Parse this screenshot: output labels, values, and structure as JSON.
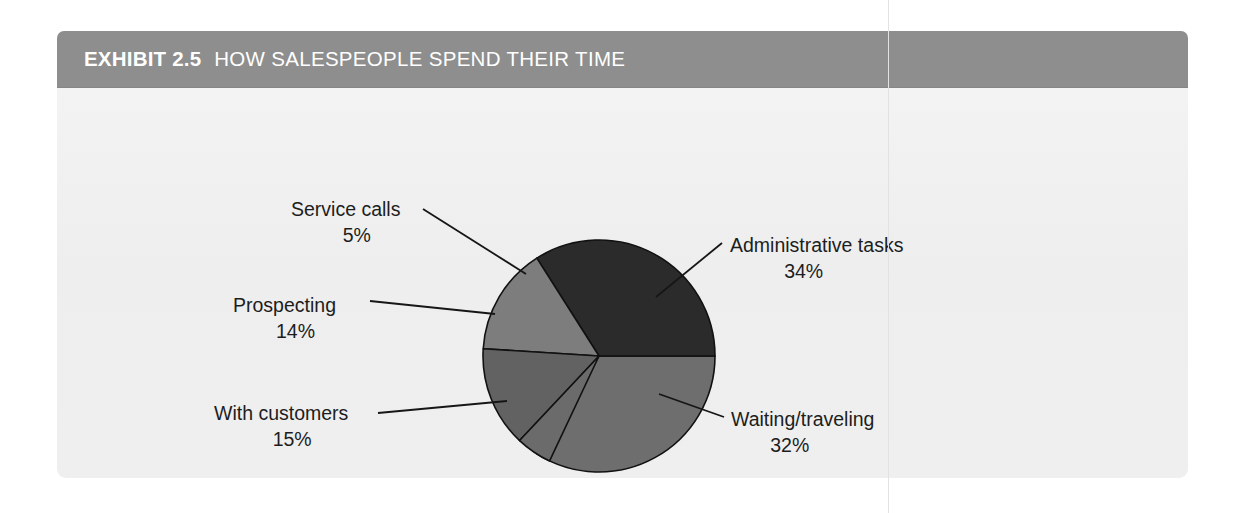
{
  "exhibit": {
    "number_label": "EXHIBIT 2.5",
    "title": "HOW SALESPEOPLE SPEND THEIR TIME",
    "header_color": "#8e8e8e",
    "body_color": "#efefef"
  },
  "chart_data": {
    "type": "pie",
    "title": "HOW SALESPEOPLE SPEND THEIR TIME",
    "xlabel": "",
    "ylabel": "",
    "legend": "none",
    "grid": false,
    "units": "percent",
    "start_angle_deg": 0,
    "direction": "clockwise",
    "categories": [
      "Administrative tasks",
      "Waiting/traveling",
      "With customers",
      "Prospecting",
      "Service calls"
    ],
    "values": [
      34,
      32,
      15,
      14,
      5
    ],
    "labels_text": [
      "34%",
      "32%",
      "15%",
      "14%",
      "5%"
    ],
    "colors": [
      "#6e6e6e",
      "#2b2b2b",
      "#7d7d7d",
      "#626262",
      "#6b6b6b"
    ],
    "slices": [
      {
        "name": "Administrative tasks",
        "value": 34,
        "value_text": "34%",
        "color": "#6e6e6e",
        "start_deg": 0,
        "end_deg": 122.4
      },
      {
        "name": "Waiting/traveling",
        "value": 32,
        "value_text": "32%",
        "color": "#2b2b2b",
        "start_deg": 237.6,
        "end_deg": 360
      },
      {
        "name": "With customers",
        "value": 15,
        "value_text": "15%",
        "color": "#7d7d7d",
        "start_deg": 183.6,
        "end_deg": 237.6
      },
      {
        "name": "Prospecting",
        "value": 14,
        "value_text": "14%",
        "color": "#626262",
        "start_deg": 133.2,
        "end_deg": 183.6
      },
      {
        "name": "Service calls",
        "value": 5,
        "value_text": "5%",
        "color": "#6b6b6b",
        "start_deg": 115.2,
        "end_deg": 133.2
      }
    ]
  },
  "callouts": {
    "administrative": {
      "name": "Administrative tasks",
      "pct": "34%"
    },
    "waiting": {
      "name": "Waiting/traveling",
      "pct": "32%"
    },
    "with_customers": {
      "name": "With customers",
      "pct": "15%"
    },
    "prospecting": {
      "name": "Prospecting",
      "pct": "14%"
    },
    "service_calls": {
      "name": "Service calls",
      "pct": "5%"
    }
  }
}
